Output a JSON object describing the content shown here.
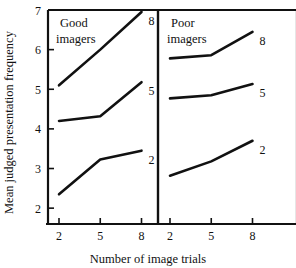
{
  "figure": {
    "background_color": "#ffffff",
    "ink_color": "#111111",
    "y_axis_title": "Mean judged presentation frequency",
    "x_axis_title": "Number of image trials"
  },
  "chart_data": {
    "type": "line",
    "title": "",
    "xlabel": "Number of image trials",
    "ylabel": "Mean judged presentation frequency",
    "x": [
      2,
      5,
      8
    ],
    "xtick_labels": [
      "2",
      "5",
      "8"
    ],
    "ytick_labels": [
      "2",
      "3",
      "4",
      "5",
      "6",
      "7"
    ],
    "yticks": [
      2,
      3,
      4,
      5,
      6,
      7
    ],
    "ylim": [
      1.6,
      7.0
    ],
    "xlim": [
      1.2,
      9.2
    ],
    "grid": false,
    "legend": "inline-right-of-line-end",
    "panels": [
      {
        "name": "good-imagers",
        "label": "Good\nimagers",
        "label_line1": "Good",
        "label_line2": "imagers",
        "series": [
          {
            "name": "8",
            "label": "8",
            "values": [
              5.1,
              6.0,
              6.95
            ]
          },
          {
            "name": "5",
            "label": "5",
            "values": [
              4.2,
              4.32,
              5.18
            ]
          },
          {
            "name": "2",
            "label": "2",
            "values": [
              2.35,
              3.23,
              3.45
            ]
          }
        ]
      },
      {
        "name": "poor-imagers",
        "label": "Poor\nimagers",
        "label_line1": "Poor",
        "label_line2": "imagers",
        "series": [
          {
            "name": "8",
            "label": "8",
            "values": [
              5.78,
              5.86,
              6.45
            ]
          },
          {
            "name": "5",
            "label": "5",
            "values": [
              4.77,
              4.85,
              5.13
            ]
          },
          {
            "name": "2",
            "label": "2",
            "values": [
              2.82,
              3.18,
              3.7
            ]
          }
        ]
      }
    ]
  }
}
